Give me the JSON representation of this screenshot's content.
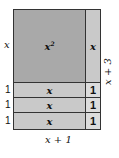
{
  "diagram": {
    "type": "algebra-tiles",
    "tiles": {
      "square": {
        "label": "x",
        "exponent": "2"
      },
      "vertical_rect": {
        "label": "x"
      },
      "horizontal_rects": [
        {
          "label": "x"
        },
        {
          "label": "x"
        },
        {
          "label": "x"
        }
      ],
      "unit_squares": [
        {
          "label": "1"
        },
        {
          "label": "1"
        },
        {
          "label": "1"
        }
      ]
    },
    "left_labels": {
      "top": "x",
      "rows": [
        "1",
        "1",
        "1"
      ]
    },
    "right_label": "x + 3",
    "bottom_label": "x + 1",
    "colors": {
      "square": "#a9a9a9",
      "rect": "#c9c9c9",
      "unit": "#dcdcdc",
      "border": "#333333"
    }
  }
}
